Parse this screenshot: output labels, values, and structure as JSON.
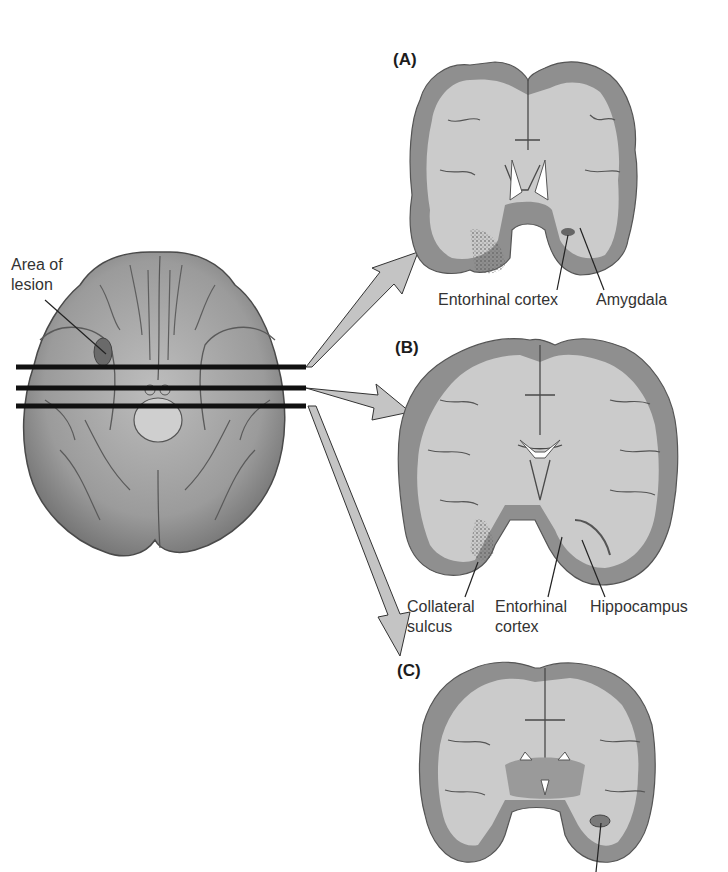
{
  "figure": {
    "colors": {
      "background": "#ffffff",
      "brain_surface": "#9a9a9a",
      "brain_surface_light": "#b8b8b8",
      "gray_matter": "#8f8f8f",
      "white_matter": "#c9c9c9",
      "cut_lines": "#111111",
      "arrow_fill": "#c4c4c4",
      "lesion_dots": "#555555"
    },
    "ventral_view": {
      "label_line1": "Area of",
      "label_line2": "lesion",
      "cut_lines_count": 3
    },
    "panels": [
      {
        "id": "A",
        "label": "(A)",
        "annotations": [
          {
            "text": "Entorhinal cortex"
          },
          {
            "text": "Amygdala"
          }
        ]
      },
      {
        "id": "B",
        "label": "(B)",
        "annotations": [
          {
            "line1": "Collateral",
            "line2": "sulcus"
          },
          {
            "line1": "Entorhinal",
            "line2": "cortex"
          },
          {
            "line1": "Hippocampus",
            "line2": ""
          }
        ]
      },
      {
        "id": "C",
        "label": "(C)",
        "annotations": []
      }
    ]
  }
}
